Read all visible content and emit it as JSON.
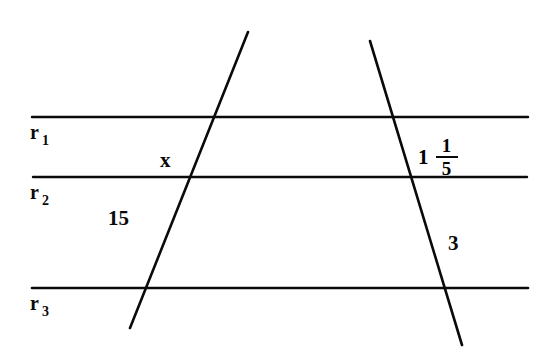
{
  "figure": {
    "background_color": "#ffffff",
    "stroke_color": "#0a0a0a",
    "width": 543,
    "height": 357
  },
  "parallel_lines": [
    {
      "name": "r1",
      "base": "r",
      "subscript": "1",
      "y": 117,
      "x_start": 32,
      "x_end": 528,
      "label_x": 30,
      "label_y": 122
    },
    {
      "name": "r2",
      "base": "r",
      "subscript": "2",
      "y": 177,
      "x_start": 33,
      "x_end": 527,
      "label_x": 30,
      "label_y": 182
    },
    {
      "name": "r3",
      "base": "r",
      "subscript": "3",
      "y": 288,
      "x_start": 32,
      "x_end": 528,
      "label_x": 30,
      "label_y": 293
    }
  ],
  "transversals": [
    {
      "name": "left-transversal",
      "x1": 248,
      "y1": 32,
      "x2": 130,
      "y2": 328
    },
    {
      "name": "right-transversal",
      "x1": 370,
      "y1": 41,
      "x2": 462,
      "y2": 345
    }
  ],
  "measures": [
    {
      "name": "segment-x",
      "text": "x",
      "x": 160,
      "y": 150,
      "kind": "unknown"
    },
    {
      "name": "segment-15",
      "text": "15",
      "x": 108,
      "y": 208,
      "kind": "number"
    },
    {
      "name": "segment-3",
      "text": "3",
      "x": 448,
      "y": 233,
      "kind": "number"
    }
  ],
  "mixed_number": {
    "name": "segment-one-and-one-fifth",
    "whole": "1",
    "numerator": "1",
    "denominator": "5",
    "x": 418,
    "y": 136
  }
}
